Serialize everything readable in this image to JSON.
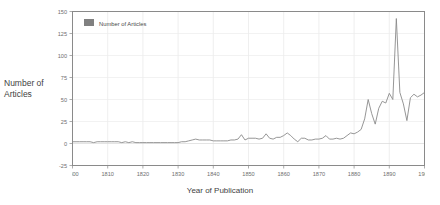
{
  "chart_data": {
    "type": "line",
    "title": "",
    "xlabel": "Year of Publication",
    "ylabel": "Number of Articles",
    "ylabel_lines": [
      "Number of",
      "Articles"
    ],
    "xlim": [
      1800,
      1900
    ],
    "ylim": [
      -25,
      150
    ],
    "grid": true,
    "legend_position": "top-left-inside",
    "legend": [
      {
        "name": "Number of Articles",
        "color": "#808080"
      }
    ],
    "series": [
      {
        "name": "Number of Articles",
        "color": "#8a8a8a",
        "x": [
          1800,
          1801,
          1802,
          1803,
          1804,
          1805,
          1806,
          1807,
          1808,
          1809,
          1810,
          1811,
          1812,
          1813,
          1814,
          1815,
          1816,
          1817,
          1818,
          1819,
          1820,
          1821,
          1822,
          1823,
          1824,
          1825,
          1826,
          1827,
          1828,
          1829,
          1830,
          1831,
          1832,
          1833,
          1834,
          1835,
          1836,
          1837,
          1838,
          1839,
          1840,
          1841,
          1842,
          1843,
          1844,
          1845,
          1846,
          1847,
          1848,
          1849,
          1850,
          1851,
          1852,
          1853,
          1854,
          1855,
          1856,
          1857,
          1858,
          1859,
          1860,
          1861,
          1862,
          1863,
          1864,
          1865,
          1866,
          1867,
          1868,
          1869,
          1870,
          1871,
          1872,
          1873,
          1874,
          1875,
          1876,
          1877,
          1878,
          1879,
          1880,
          1881,
          1882,
          1883,
          1884,
          1885,
          1886,
          1887,
          1888,
          1889,
          1890,
          1891,
          1892,
          1893,
          1894,
          1895,
          1896,
          1897,
          1898,
          1899,
          1900
        ],
        "values": [
          2,
          2,
          2,
          2,
          2,
          2,
          1,
          2,
          2,
          2,
          2,
          2,
          2,
          2,
          1,
          2,
          1,
          2,
          1,
          1,
          1,
          1,
          1,
          1,
          1,
          1,
          1,
          1,
          1,
          1,
          1,
          2,
          2,
          3,
          4,
          5,
          4,
          4,
          4,
          4,
          3,
          3,
          3,
          3,
          3,
          4,
          4,
          5,
          10,
          4,
          6,
          6,
          6,
          5,
          6,
          11,
          6,
          5,
          7,
          7,
          9,
          12,
          9,
          5,
          2,
          6,
          6,
          4,
          4,
          5,
          5,
          6,
          9,
          5,
          5,
          6,
          5,
          6,
          9,
          12,
          11,
          13,
          16,
          28,
          50,
          34,
          22,
          40,
          48,
          46,
          57,
          50,
          142,
          58,
          45,
          26,
          52,
          56,
          53,
          55,
          58
        ]
      }
    ],
    "xticks": [
      1800,
      1810,
      1820,
      1830,
      1840,
      1850,
      1860,
      1870,
      1880,
      1890,
      1900
    ],
    "yticks": [
      -25,
      0,
      25,
      50,
      75,
      100,
      125,
      150
    ]
  }
}
